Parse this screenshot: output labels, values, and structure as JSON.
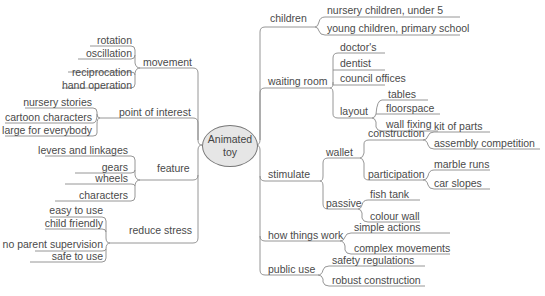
{
  "center": {
    "line1": "Animated",
    "line2": "toy"
  },
  "left": {
    "movement": {
      "label": "movement",
      "items": [
        "rotation",
        "oscillation",
        "reciprocation",
        "hand operation"
      ]
    },
    "point_of_interest": {
      "label": "point of interest",
      "items": [
        "nursery stories",
        "cartoon characters",
        "large for everybody"
      ]
    },
    "feature": {
      "label": "feature",
      "items": [
        "levers and linkages",
        "gears",
        "wheels",
        "characters"
      ]
    },
    "reduce_stress": {
      "label": "reduce stress",
      "items": [
        "easy to use",
        "child friendly",
        "no parent supervision",
        "safe to use"
      ]
    }
  },
  "right": {
    "children": {
      "label": "children",
      "items": [
        "nursery children, under 5",
        "young children, primary school"
      ]
    },
    "waiting_room": {
      "label": "waiting room",
      "items": [
        "doctor's",
        "dentist",
        "council offices"
      ],
      "layout": {
        "label": "layout",
        "items": [
          "tables",
          "floorspace",
          "wall fixing"
        ]
      }
    },
    "stimulate": {
      "label": "stimulate",
      "wallet": {
        "label": "wallet",
        "construction": {
          "label": "construction",
          "items": [
            "kit of parts",
            "assembly competition"
          ]
        },
        "participation": {
          "label": "participation",
          "items": [
            "marble runs",
            "car slopes"
          ]
        }
      },
      "passive": {
        "label": "passive",
        "items": [
          "fish tank",
          "colour wall"
        ]
      }
    },
    "how_things_work": {
      "label": "how things work",
      "items": [
        "simple actions",
        "complex movements"
      ]
    },
    "public_use": {
      "label": "public use",
      "items": [
        "safety regulations",
        "robust construction"
      ]
    }
  }
}
